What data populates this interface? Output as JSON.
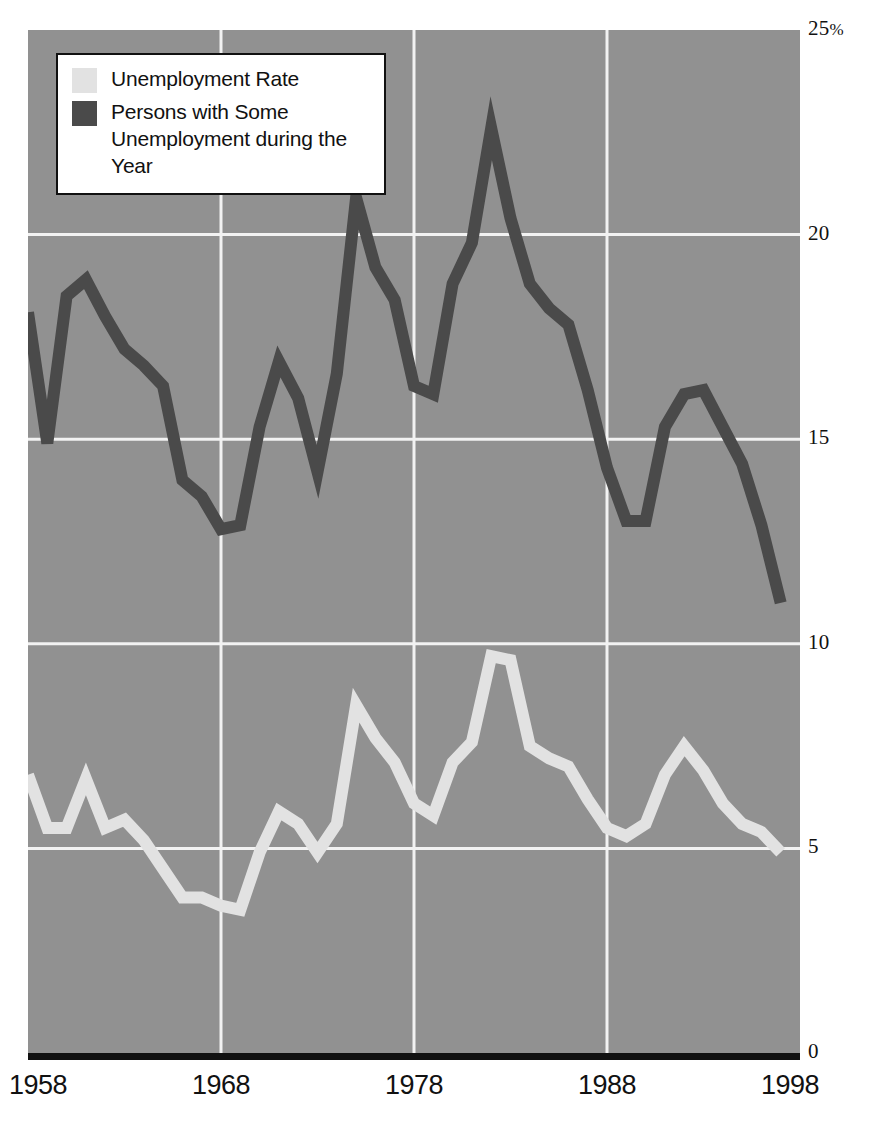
{
  "chart_data": {
    "type": "line",
    "title": "",
    "subtitle": "",
    "xlabel": "",
    "ylabel": "",
    "xlim": [
      1958,
      1998
    ],
    "ylim": [
      0,
      25
    ],
    "grid": true,
    "grid_y_values": [
      5,
      10,
      15,
      20
    ],
    "grid_x_values": [
      1968,
      1978,
      1988
    ],
    "legend_position": "top-left",
    "y_tick_labels": [
      "0",
      "5",
      "10",
      "15",
      "20",
      "25%"
    ],
    "y_ticks": [
      0,
      5,
      10,
      15,
      20,
      25
    ],
    "x_tick_labels": [
      "1958",
      "1968",
      "1978",
      "1988",
      "1998"
    ],
    "x_ticks": [
      1958,
      1968,
      1978,
      1988,
      1998
    ],
    "x": [
      1958,
      1959,
      1960,
      1961,
      1962,
      1963,
      1964,
      1965,
      1966,
      1967,
      1968,
      1969,
      1970,
      1971,
      1972,
      1973,
      1974,
      1975,
      1976,
      1977,
      1978,
      1979,
      1980,
      1981,
      1982,
      1983,
      1984,
      1985,
      1986,
      1987,
      1988,
      1989,
      1990,
      1991,
      1992,
      1993,
      1994,
      1995,
      1996,
      1997
    ],
    "series": [
      {
        "name": "Unemployment Rate",
        "color": "#e2e2e2",
        "values": [
          6.8,
          5.5,
          5.5,
          6.7,
          5.5,
          5.7,
          5.2,
          4.5,
          3.8,
          3.8,
          3.6,
          3.5,
          4.9,
          5.9,
          5.6,
          4.9,
          5.6,
          8.5,
          7.7,
          7.1,
          6.1,
          5.8,
          7.1,
          7.6,
          9.7,
          9.6,
          7.5,
          7.2,
          7.0,
          6.2,
          5.5,
          5.3,
          5.6,
          6.8,
          7.5,
          6.9,
          6.1,
          5.6,
          5.4,
          4.9
        ]
      },
      {
        "name": "Persons with Some Unemployment during the Year",
        "color": "#4a4a4a",
        "values": [
          18.1,
          14.9,
          18.5,
          18.9,
          18.0,
          17.2,
          16.8,
          16.3,
          14.0,
          13.6,
          12.8,
          12.9,
          15.3,
          16.9,
          16.0,
          14.2,
          16.6,
          20.9,
          19.2,
          18.4,
          16.3,
          16.1,
          18.8,
          19.8,
          22.6,
          20.4,
          18.8,
          18.2,
          17.8,
          16.2,
          14.3,
          13.0,
          13.0,
          15.3,
          16.1,
          16.2,
          15.3,
          14.4,
          12.9,
          11.0
        ]
      }
    ]
  },
  "legend": {
    "entries": [
      {
        "label": "Unemployment Rate",
        "swatch": "light"
      },
      {
        "label": "Persons with Some\nUnemployment during the Year",
        "swatch": "dark"
      }
    ],
    "entry_1_label": "Unemployment Rate",
    "entry_2_line_1": "Persons with Some",
    "entry_2_line_2": "Unemployment during the Year"
  },
  "axis": {
    "y_top_label": "25",
    "y_top_suffix": "%",
    "y_label_20": "20",
    "y_label_15": "15",
    "y_label_10": "10",
    "y_label_5": "5",
    "y_label_0": "0",
    "x_label_1": "1958",
    "x_label_2": "1968",
    "x_label_3": "1978",
    "x_label_4": "1988",
    "x_label_5": "1998"
  },
  "colors": {
    "plot_background": "#919191",
    "gridline": "#f2f2f2",
    "axis_line": "#111111",
    "series_light": "#e2e2e2",
    "series_dark": "#4a4a4a",
    "page_background": "#ffffff",
    "text": "#111111"
  }
}
